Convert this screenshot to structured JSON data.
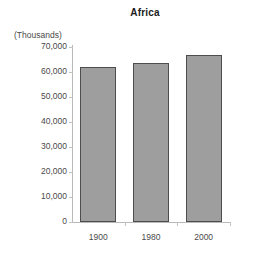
{
  "chart_data": {
    "type": "bar",
    "title": "Africa",
    "ylabel": "(Thousands)",
    "xlabel": "",
    "categories": [
      "1900",
      "1980",
      "2000"
    ],
    "values": [
      62200,
      63500,
      66800
    ],
    "ylim": [
      0,
      70000
    ],
    "yticks": [
      0,
      10000,
      20000,
      30000,
      40000,
      50000,
      60000,
      70000
    ],
    "ytick_labels": [
      "0",
      "10,000",
      "20,000",
      "30,000",
      "40,000",
      "50,000",
      "60,000",
      "70,000"
    ],
    "grid": false,
    "legend": null,
    "bar_color": "#9e9e9e",
    "bar_border_color": "#4d4d4d",
    "axis_color": "#b9b9b9",
    "text_color": "#4a4a4a",
    "background": "#ffffff"
  }
}
